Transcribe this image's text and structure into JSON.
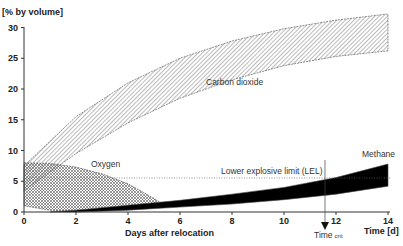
{
  "chart_data": {
    "type": "area",
    "title": "",
    "ylabel": "[% by volume]",
    "xlabel": "Days after relocation",
    "xlabel_right": "Time [d]",
    "xlim": [
      0,
      14
    ],
    "ylim": [
      0,
      30
    ],
    "x_ticks": [
      "0",
      "2",
      "4",
      "6",
      "8",
      "10",
      "12",
      "14"
    ],
    "y_ticks": [
      "0",
      "5",
      "10",
      "15",
      "20",
      "25",
      "30"
    ],
    "grid": false,
    "series": [
      {
        "name": "Carbon dioxide",
        "fill": "hatched-diagonal",
        "x": [
          0,
          2,
          4,
          6,
          8,
          10,
          12,
          14
        ],
        "upper": [
          7.5,
          15.5,
          21,
          25,
          27.8,
          29.8,
          31.2,
          32.2
        ],
        "lower": [
          3.5,
          9.5,
          14.5,
          18.5,
          21.5,
          23.8,
          25.3,
          26.2
        ]
      },
      {
        "name": "Oxygen",
        "fill": "crosshatch",
        "x": [
          0,
          1,
          2,
          3,
          4,
          5,
          5.3
        ],
        "upper": [
          8,
          7.9,
          7.3,
          6.2,
          4.6,
          2.2,
          1.4
        ],
        "lower": [
          1,
          0.3,
          0.1,
          0.2,
          0.4,
          0.9,
          1.1
        ]
      },
      {
        "name": "Methane",
        "fill": "solid-black",
        "x": [
          1,
          2,
          4,
          6,
          8,
          10,
          12,
          14
        ],
        "upper": [
          0,
          0.3,
          1.1,
          1.9,
          2.9,
          4.0,
          5.6,
          7.8
        ],
        "lower": [
          0,
          0,
          0.3,
          0.8,
          1.3,
          2.0,
          2.9,
          4.2
        ]
      }
    ],
    "annotations": [
      {
        "text": "Lower explosive limit (LEL)",
        "type": "hline",
        "y": 5.4,
        "style": "dotted"
      },
      {
        "text": "Time crit",
        "type": "vline",
        "x": 11.6,
        "arrow": "down"
      }
    ]
  },
  "labels": {
    "ylabel": "[% by volume]",
    "xlabel": "Days after relocation",
    "xlabel_right": "Time [d]",
    "co2": "Carbon dioxide",
    "oxygen": "Oxygen",
    "methane": "Methane",
    "lel": "Lower explosive limit (LEL)",
    "timecrit": "Time",
    "timecrit_sub": "crit"
  }
}
